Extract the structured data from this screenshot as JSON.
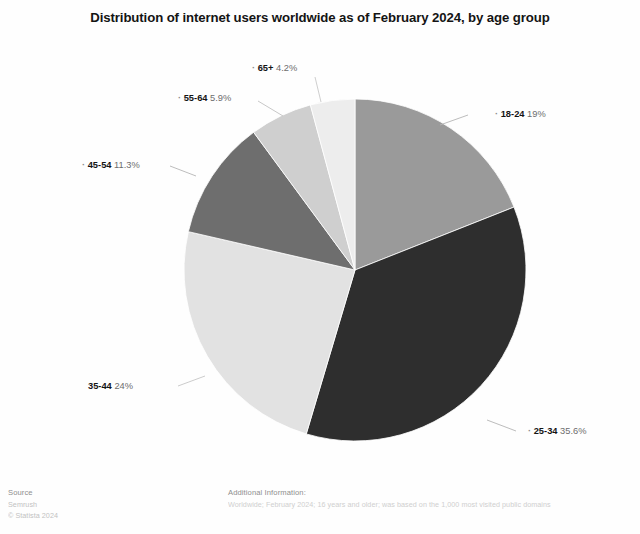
{
  "header": {
    "title": "Distribution of internet users worldwide as of February 2024, by age group"
  },
  "chart_data": {
    "type": "pie",
    "title": "Distribution of internet users worldwide as of February 2024, by age group",
    "xlabel": "",
    "ylabel": "",
    "unit": "%",
    "legend_position": "none",
    "labels_position": "outside-callout",
    "start_angle_deg": 0,
    "direction": "clockwise",
    "categories": [
      "18-24",
      "25-34",
      "35-44",
      "45-54",
      "55-64",
      "65+"
    ],
    "values": [
      19,
      35.6,
      24,
      11.3,
      5.9,
      4.2
    ],
    "value_labels": [
      "19%",
      "35.6%",
      "24%",
      "11.3%",
      "5.9%",
      "4.2%"
    ],
    "colors": [
      "#9a9a9a",
      "#2e2e2e",
      "#e2e2e2",
      "#6e6e6e",
      "#cfcfcf",
      "#ededed"
    ],
    "slices": [
      {
        "name": "18-24",
        "value": 19,
        "value_label": "19%",
        "color": "#9a9a9a"
      },
      {
        "name": "25-34",
        "value": 35.6,
        "value_label": "35.6%",
        "color": "#2e2e2e"
      },
      {
        "name": "35-44",
        "value": 24,
        "value_label": "24%",
        "color": "#e2e2e2"
      },
      {
        "name": "45-54",
        "value": 11.3,
        "value_label": "11.3%",
        "color": "#6e6e6e"
      },
      {
        "name": "55-64",
        "value": 5.9,
        "value_label": "5.9%",
        "color": "#cfcfcf"
      },
      {
        "name": "65+",
        "value": 4.2,
        "value_label": "4.2%",
        "color": "#ededed"
      }
    ]
  },
  "footer": {
    "source_heading": "Source",
    "source_name": "Semrush",
    "copyright": "© Statista 2024",
    "info_heading": "Additional Information:",
    "info_detail": "Worldwide; February 2024; 16 years and older; was based on the 1,000 most visited public domains"
  }
}
